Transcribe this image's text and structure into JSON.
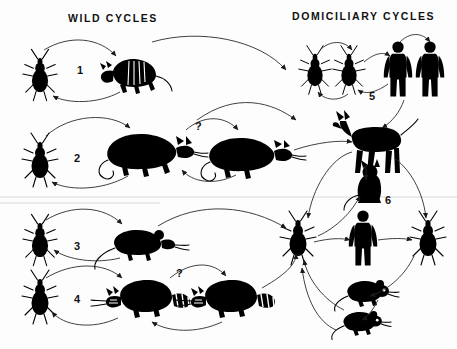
{
  "figure": {
    "headers": [
      {
        "id": "wild",
        "label": "WILD CYCLES",
        "x": 68,
        "y": 12
      },
      {
        "id": "domiciliary",
        "label": "DOMICILIARY CYCLES",
        "x": 292,
        "y": 10
      }
    ],
    "cycle_labels": [
      {
        "id": "cycle-1",
        "label": "1",
        "x": 77,
        "y": 64
      },
      {
        "id": "cycle-2",
        "label": "2",
        "x": 74,
        "y": 152
      },
      {
        "id": "cycle-3",
        "label": "3",
        "x": 74,
        "y": 240
      },
      {
        "id": "cycle-4",
        "label": "4",
        "x": 74,
        "y": 293
      },
      {
        "id": "cycle-5",
        "label": "5",
        "x": 369,
        "y": 90
      },
      {
        "id": "cycle-6",
        "label": "6",
        "x": 385,
        "y": 194
      }
    ],
    "uncertainty_marks": [
      {
        "id": "question-row2",
        "label": "?",
        "x": 195,
        "y": 120
      },
      {
        "id": "question-row4",
        "label": "?",
        "x": 176,
        "y": 267
      }
    ],
    "organisms": [
      {
        "id": "bug-1",
        "type": "triatomine-bug",
        "cycle": "1",
        "x": 40,
        "y": 75
      },
      {
        "id": "armadillo-1",
        "type": "armadillo",
        "cycle": "1",
        "x": 132,
        "y": 73
      },
      {
        "id": "bug-2",
        "type": "triatomine-bug",
        "cycle": "2",
        "x": 40,
        "y": 160
      },
      {
        "id": "opossum-2a",
        "type": "opossum",
        "cycle": "2",
        "x": 140,
        "y": 152
      },
      {
        "id": "opossum-2b",
        "type": "opossum",
        "cycle": "2",
        "x": 240,
        "y": 155
      },
      {
        "id": "bug-3",
        "type": "triatomine-bug",
        "cycle": "3",
        "x": 40,
        "y": 240
      },
      {
        "id": "rat-3",
        "type": "rat",
        "cycle": "3",
        "x": 135,
        "y": 243
      },
      {
        "id": "bug-4",
        "type": "triatomine-bug",
        "cycle": "4",
        "x": 40,
        "y": 297
      },
      {
        "id": "raccoon-4a",
        "type": "raccoon",
        "cycle": "4",
        "x": 143,
        "y": 297
      },
      {
        "id": "raccoon-4b",
        "type": "raccoon",
        "cycle": "4",
        "x": 228,
        "y": 297
      },
      {
        "id": "bug-5a",
        "type": "triatomine-bug",
        "cycle": "5",
        "x": 315,
        "y": 70
      },
      {
        "id": "bug-5b",
        "type": "triatomine-bug",
        "cycle": "5",
        "x": 349,
        "y": 70
      },
      {
        "id": "human-5a",
        "type": "human",
        "cycle": "5",
        "x": 398,
        "y": 68
      },
      {
        "id": "human-5b",
        "type": "human",
        "cycle": "5",
        "x": 430,
        "y": 68
      },
      {
        "id": "dog-6",
        "type": "dog",
        "cycle": "6",
        "x": 372,
        "y": 143
      },
      {
        "id": "cat-6",
        "type": "cat",
        "cycle": "6",
        "x": 368,
        "y": 183
      },
      {
        "id": "human-6",
        "type": "human",
        "cycle": "6",
        "x": 363,
        "y": 237
      },
      {
        "id": "bug-6a",
        "type": "triatomine-bug",
        "cycle": "6",
        "x": 298,
        "y": 238
      },
      {
        "id": "bug-6b",
        "type": "triatomine-bug",
        "cycle": "6",
        "x": 428,
        "y": 238
      },
      {
        "id": "mouse-6a",
        "type": "mouse",
        "cycle": "6",
        "x": 362,
        "y": 292
      },
      {
        "id": "mouse-6b",
        "type": "mouse",
        "cycle": "6",
        "x": 357,
        "y": 322
      }
    ],
    "colors": {
      "ink": "#000000",
      "background": "#ffffff",
      "arrow": "#222222"
    }
  }
}
